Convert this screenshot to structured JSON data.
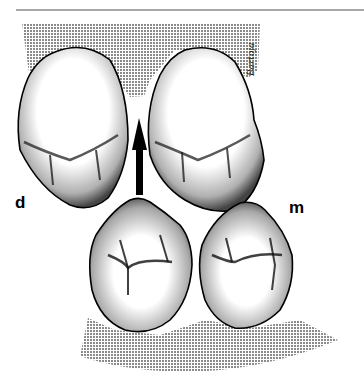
{
  "figure": {
    "type": "dental occlusal illustration",
    "labels": {
      "distal": "d",
      "mesial": "m"
    },
    "signature": "Bartoja",
    "arrow": {
      "direction": "up"
    },
    "teeth": [
      {
        "name": "upper-left-molar"
      },
      {
        "name": "upper-right-molar"
      },
      {
        "name": "lower-left-molar"
      },
      {
        "name": "lower-right-molar"
      }
    ],
    "colors": {
      "shading": "#9a9a9a",
      "outline": "#000000",
      "rule": "#a8a8a8",
      "background": "#ffffff"
    }
  }
}
